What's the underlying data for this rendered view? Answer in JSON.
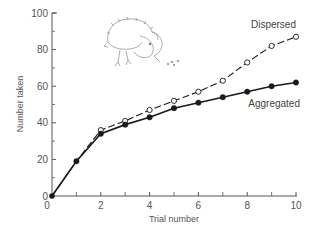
{
  "chart_data": {
    "type": "line",
    "title": "",
    "xlabel": "Trial number",
    "ylabel": "Number taken",
    "xlim": [
      0,
      10
    ],
    "ylim": [
      0,
      100
    ],
    "x_ticks_major": [
      0,
      2,
      4,
      6,
      8,
      10
    ],
    "x_ticks_minor": [
      1,
      3,
      5,
      7,
      9
    ],
    "y_ticks_major": [
      0,
      20,
      40,
      60,
      80,
      100
    ],
    "y_ticks_minor": [
      10,
      30,
      50,
      70,
      90
    ],
    "grid": false,
    "legend": "inline labels at line ends",
    "x": [
      0,
      1,
      2,
      3,
      4,
      5,
      6,
      7,
      8,
      9,
      10
    ],
    "series": [
      {
        "name": "Dispersed",
        "style": "dashed line, open circle markers",
        "values": [
          0,
          19,
          36,
          41,
          47,
          52,
          57,
          63,
          73,
          82,
          87
        ]
      },
      {
        "name": "Aggregated",
        "style": "solid line, filled circle markers",
        "values": [
          0,
          19,
          34,
          39,
          43,
          48,
          51,
          54,
          57,
          60,
          62
        ]
      }
    ],
    "annotations": [
      "bird illustration (foraging bird pecking at food items)"
    ]
  },
  "colors": {
    "line": "#1a1a1a",
    "axis": "#555555",
    "text": "#444444",
    "background": "#ffffff"
  }
}
